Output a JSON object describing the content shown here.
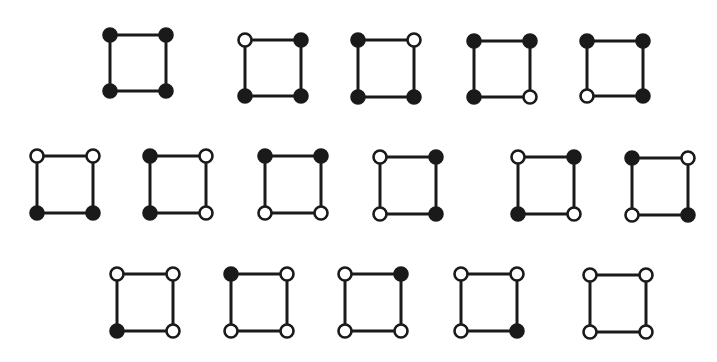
{
  "figure": {
    "vertex_order": [
      "top-left",
      "top-right",
      "bottom-left",
      "bottom-right"
    ],
    "colors": {
      "filled": "#1a1a1a",
      "open": "#ffffff",
      "edge": "#1a1a1a"
    },
    "rows": [
      {
        "squares": [
          {
            "vertices": [
              "filled",
              "filled",
              "filled",
              "filled"
            ]
          },
          {
            "vertices": [
              "open",
              "filled",
              "filled",
              "filled"
            ]
          },
          {
            "vertices": [
              "filled",
              "open",
              "filled",
              "filled"
            ]
          },
          {
            "vertices": [
              "filled",
              "filled",
              "filled",
              "open"
            ]
          },
          {
            "vertices": [
              "filled",
              "filled",
              "open",
              "filled"
            ]
          }
        ]
      },
      {
        "squares": [
          {
            "vertices": [
              "open",
              "open",
              "filled",
              "filled"
            ]
          },
          {
            "vertices": [
              "filled",
              "open",
              "filled",
              "open"
            ]
          },
          {
            "vertices": [
              "filled",
              "filled",
              "open",
              "open"
            ]
          },
          {
            "vertices": [
              "open",
              "filled",
              "open",
              "filled"
            ]
          },
          {
            "vertices": [
              "open",
              "filled",
              "filled",
              "open"
            ]
          },
          {
            "vertices": [
              "filled",
              "open",
              "open",
              "filled"
            ]
          }
        ]
      },
      {
        "squares": [
          {
            "vertices": [
              "open",
              "open",
              "filled",
              "open"
            ]
          },
          {
            "vertices": [
              "filled",
              "open",
              "open",
              "open"
            ]
          },
          {
            "vertices": [
              "open",
              "filled",
              "open",
              "open"
            ]
          },
          {
            "vertices": [
              "open",
              "open",
              "open",
              "filled"
            ]
          },
          {
            "vertices": [
              "open",
              "open",
              "open",
              "open"
            ]
          }
        ]
      }
    ]
  }
}
